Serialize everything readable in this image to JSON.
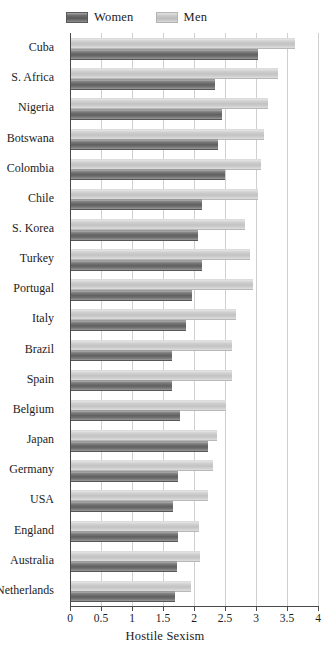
{
  "legend": {
    "position": "top-left",
    "entries": [
      {
        "label": "Women",
        "color": "#606060",
        "icon": "legend-swatch-women"
      },
      {
        "label": "Men",
        "color": "#c2c2c2",
        "icon": "legend-swatch-men"
      }
    ]
  },
  "axis": {
    "x_title": "Hostile Sexism",
    "ticks": [
      "0",
      "0.5",
      "1",
      "1.5",
      "2",
      "2.5",
      "3",
      "3.5",
      "4"
    ]
  },
  "chart_data": {
    "type": "bar",
    "orientation": "horizontal",
    "title": "",
    "xlabel": "Hostile Sexism",
    "ylabel": "",
    "xlim": [
      0,
      4
    ],
    "xticks": [
      0,
      0.5,
      1,
      1.5,
      2,
      2.5,
      3,
      3.5,
      4
    ],
    "grid": true,
    "grid_axis": "x",
    "legend_position": "top-left",
    "categories": [
      "Cuba",
      "S. Africa",
      "Nigeria",
      "Botswana",
      "Colombia",
      "Chile",
      "S. Korea",
      "Turkey",
      "Portugal",
      "Italy",
      "Brazil",
      "Spain",
      "Belgium",
      "Japan",
      "Germany",
      "USA",
      "England",
      "Australia",
      "Netherlands"
    ],
    "series": [
      {
        "name": "Men",
        "color": "#c2c2c2",
        "values": [
          3.63,
          3.35,
          3.19,
          3.13,
          3.08,
          3.03,
          2.82,
          2.9,
          2.95,
          2.68,
          2.61,
          2.61,
          2.52,
          2.37,
          2.31,
          2.23,
          2.08,
          2.1,
          1.95
        ]
      },
      {
        "name": "Women",
        "color": "#606060",
        "values": [
          3.03,
          2.34,
          2.45,
          2.39,
          2.5,
          2.13,
          2.06,
          2.13,
          1.97,
          1.87,
          1.65,
          1.65,
          1.77,
          2.23,
          1.74,
          1.66,
          1.74,
          1.72,
          1.7
        ]
      }
    ]
  }
}
